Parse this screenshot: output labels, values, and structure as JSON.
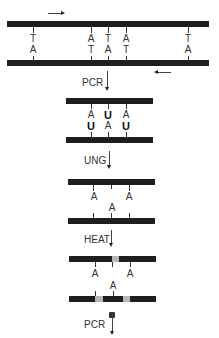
{
  "stage1": {
    "top_bases": [
      "T",
      "A",
      "T",
      "A",
      "T"
    ],
    "bottom_bases": [
      "A",
      "T",
      "A",
      "T",
      "A"
    ]
  },
  "step1": {
    "label": "PCR"
  },
  "stage2": {
    "top_bases": [
      "A",
      "U",
      "A"
    ],
    "bottom_bases": [
      "U",
      "A",
      "U"
    ]
  },
  "step2": {
    "label": "UNG"
  },
  "stage3": {
    "top_bases": [
      "A",
      "A"
    ],
    "bottom_bases": [
      "A"
    ]
  },
  "step3": {
    "label": "HEAT"
  },
  "stage4": {
    "top_bases": [
      "A",
      "A"
    ],
    "bottom_bases": [
      "A"
    ]
  },
  "step4": {
    "label": "PCR"
  },
  "colors": {
    "strand": "#1e1e1e",
    "gap": "#b8b8b8",
    "text": "#333333"
  }
}
